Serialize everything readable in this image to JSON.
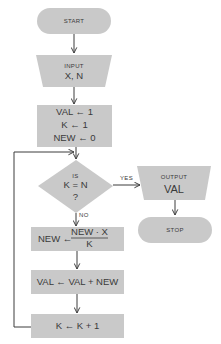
{
  "colors": {
    "shape_fill": "#c9c9c9",
    "line": "#3d3d3d",
    "text": "#3a3a3a",
    "background": "#ffffff"
  },
  "flowchart": {
    "start": {
      "label": "START"
    },
    "input": {
      "title": "INPUT",
      "vars": "X, N"
    },
    "init": {
      "line1": "VAL ← 1",
      "line2": "K ← 1",
      "line3": "NEW ← 0"
    },
    "decision": {
      "line1": "IS",
      "line2": "K = N",
      "line3": "?",
      "yes_label": "YES",
      "no_label": "NO"
    },
    "output": {
      "title": "OUTPUT",
      "var": "VAL"
    },
    "stop": {
      "label": "STOP"
    },
    "update_new": {
      "lhs": "NEW ←",
      "numerator": "NEW · X",
      "denominator": "K"
    },
    "update_val": {
      "label": "VAL ← VAL + NEW"
    },
    "increment_k": {
      "label": "K ← K + 1"
    }
  }
}
